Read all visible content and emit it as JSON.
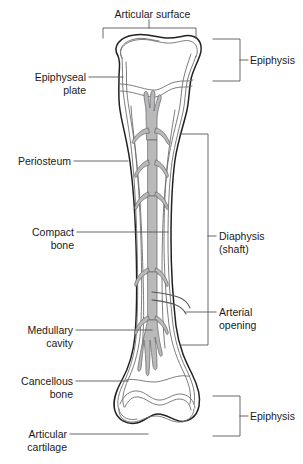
{
  "figure": {
    "width": 303,
    "height": 464,
    "background": "#ffffff",
    "ink_color": "#231f20",
    "trabecula_fill": "#b9b9b9",
    "leader_color": "#58585a"
  },
  "labels": {
    "articular_surface": {
      "line1": "Articular surface",
      "side": "top"
    },
    "epiphysis_top": {
      "line1": "Epiphysis",
      "side": "right"
    },
    "epiphyseal_plate": {
      "line1": "Epiphyseal",
      "line2": "plate",
      "side": "left"
    },
    "periosteum": {
      "line1": "Periosteum",
      "side": "left"
    },
    "compact_bone": {
      "line1": "Compact",
      "line2": "bone",
      "side": "left"
    },
    "diaphysis": {
      "line1": "Diaphysis",
      "line2": "(shaft)",
      "side": "right"
    },
    "arterial_opening": {
      "line1": "Arterial",
      "line2": "opening",
      "side": "right"
    },
    "medullary_cavity": {
      "line1": "Medullary",
      "line2": "cavity",
      "side": "left"
    },
    "cancellous_bone": {
      "line1": "Cancellous",
      "line2": "bone",
      "side": "left"
    },
    "articular_cartilage": {
      "line1": "Articular",
      "line2": "cartilage",
      "side": "left"
    },
    "epiphysis_bottom": {
      "line1": "Epiphysis",
      "side": "right"
    }
  }
}
